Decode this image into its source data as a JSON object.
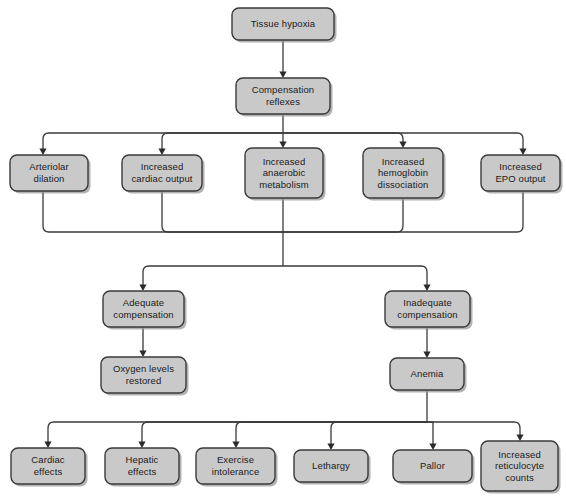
{
  "diagram": {
    "colors": {
      "node_fill": "#c9c9c9",
      "node_border": "#3a3a3a",
      "node_shadow": "#9a9a9a",
      "edge": "#3a3a3a",
      "text": "#1a1a1a",
      "background": "#ffffff"
    },
    "nodes": [
      {
        "id": "tissue-hypoxia",
        "lines": [
          "Tissue hypoxia"
        ],
        "x": 232,
        "y": 8,
        "w": 102,
        "h": 32
      },
      {
        "id": "compensation-reflexes",
        "lines": [
          "Compensation",
          "reflexes"
        ],
        "x": 236,
        "y": 78,
        "w": 94,
        "h": 36
      },
      {
        "id": "arteriolar-dilation",
        "lines": [
          "Arteriolar",
          "dilation"
        ],
        "x": 10,
        "y": 155,
        "w": 78,
        "h": 36
      },
      {
        "id": "increased-cardiac-output",
        "lines": [
          "Increased",
          "cardiac output"
        ],
        "x": 122,
        "y": 155,
        "w": 80,
        "h": 36
      },
      {
        "id": "increased-anaerobic-metabolism",
        "lines": [
          "Increased",
          "anaerobic",
          "metabolism"
        ],
        "x": 245,
        "y": 148,
        "w": 78,
        "h": 50
      },
      {
        "id": "increased-hemoglobin-dissociation",
        "lines": [
          "Increased",
          "hemoglobin",
          "dissociation"
        ],
        "x": 363,
        "y": 148,
        "w": 80,
        "h": 50
      },
      {
        "id": "increased-epo-output",
        "lines": [
          "Increased",
          "EPO output"
        ],
        "x": 481,
        "y": 155,
        "w": 79,
        "h": 36
      },
      {
        "id": "adequate-compensation",
        "lines": [
          "Adequate",
          "compensation"
        ],
        "x": 103,
        "y": 291,
        "w": 81,
        "h": 36
      },
      {
        "id": "inadequate-compensation",
        "lines": [
          "Inadequate",
          "compensation"
        ],
        "x": 385,
        "y": 291,
        "w": 85,
        "h": 36
      },
      {
        "id": "oxygen-levels-restored",
        "lines": [
          "Oxygen levels",
          "restored"
        ],
        "x": 101,
        "y": 357,
        "w": 85,
        "h": 36
      },
      {
        "id": "anemia",
        "lines": [
          "Anemia"
        ],
        "x": 390,
        "y": 358,
        "w": 74,
        "h": 32
      },
      {
        "id": "cardiac-effects",
        "lines": [
          "Cardiac",
          "effects"
        ],
        "x": 11,
        "y": 448,
        "w": 74,
        "h": 36
      },
      {
        "id": "hepatic-effects",
        "lines": [
          "Hepatic",
          "effects"
        ],
        "x": 105,
        "y": 448,
        "w": 74,
        "h": 36
      },
      {
        "id": "exercise-intolerance",
        "lines": [
          "Exercise",
          "intolerance"
        ],
        "x": 196,
        "y": 448,
        "w": 79,
        "h": 36
      },
      {
        "id": "lethargy",
        "lines": [
          "Lethargy"
        ],
        "x": 294,
        "y": 450,
        "w": 74,
        "h": 32
      },
      {
        "id": "pallor",
        "lines": [
          "Pallor"
        ],
        "x": 393,
        "y": 450,
        "w": 79,
        "h": 32
      },
      {
        "id": "increased-reticulocyte-counts",
        "lines": [
          "Increased",
          "reticulocyte",
          "counts"
        ],
        "x": 481,
        "y": 441,
        "w": 77,
        "h": 50
      }
    ],
    "edges": [
      {
        "id": "hypoxia-to-reflexes",
        "path": "M 283 40 L 283 72",
        "arrow": "down",
        "ax": 283,
        "ay": 78
      },
      {
        "id": "reflexes-bus-stem",
        "path": "M 283 114 L 283 133",
        "arrow": "none"
      },
      {
        "id": "reflexes-bus-left",
        "path": "M 283 133 L 49 133 Q 43 133 43 139 L 43 149",
        "arrow": "down",
        "ax": 43,
        "ay": 155
      },
      {
        "id": "reflexes-to-cardiac",
        "path": "M 283 133 L 168 133 Q 162 133 162 139 L 162 149",
        "arrow": "down",
        "ax": 162,
        "ay": 155
      },
      {
        "id": "reflexes-to-anaerobic",
        "path": "M 283 133 L 283 142",
        "arrow": "down",
        "ax": 283,
        "ay": 148
      },
      {
        "id": "reflexes-to-hemoglobin",
        "path": "M 283 133 L 397 133 Q 403 133 403 139 L 403 142",
        "arrow": "down",
        "ax": 403,
        "ay": 148
      },
      {
        "id": "reflexes-bus-right",
        "path": "M 283 133 L 517 133 Q 523 133 523 139 L 523 149",
        "arrow": "down",
        "ax": 523,
        "ay": 155
      },
      {
        "id": "arteriolar-merge",
        "path": "M 43 191 L 43 226 Q 43 232 49 232 L 283 232",
        "arrow": "none"
      },
      {
        "id": "cardiac-merge",
        "path": "M 162 191 L 162 226 Q 162 232 168 232 L 283 232",
        "arrow": "none"
      },
      {
        "id": "anaerobic-merge",
        "path": "M 283 198 L 283 232",
        "arrow": "none"
      },
      {
        "id": "hemoglobin-merge",
        "path": "M 403 198 L 403 226 Q 403 232 397 232 L 283 232",
        "arrow": "none"
      },
      {
        "id": "epo-merge",
        "path": "M 523 191 L 523 226 Q 523 232 517 232 L 283 232",
        "arrow": "none"
      },
      {
        "id": "merge-stem",
        "path": "M 283 232 L 283 266",
        "arrow": "none"
      },
      {
        "id": "split-to-adequate",
        "path": "M 283 266 L 149 266 Q 143 266 143 272 L 143 285",
        "arrow": "down",
        "ax": 143,
        "ay": 291
      },
      {
        "id": "split-to-inadequate",
        "path": "M 283 266 L 421 266 Q 427 266 427 272 L 427 285",
        "arrow": "down",
        "ax": 427,
        "ay": 291
      },
      {
        "id": "adequate-to-oxygen",
        "path": "M 143 327 L 143 351",
        "arrow": "down",
        "ax": 143,
        "ay": 357
      },
      {
        "id": "inadequate-to-anemia",
        "path": "M 427 327 L 427 352",
        "arrow": "down",
        "ax": 427,
        "ay": 358
      },
      {
        "id": "anemia-bus-stem",
        "path": "M 427 390 L 427 422",
        "arrow": "none"
      },
      {
        "id": "anemia-to-cardiac-effects",
        "path": "M 427 422 L 54 422 Q 48 422 48 428 L 48 442",
        "arrow": "down",
        "ax": 48,
        "ay": 448
      },
      {
        "id": "anemia-to-hepatic-effects",
        "path": "M 427 422 L 148 422 Q 142 422 142 428 L 142 442",
        "arrow": "down",
        "ax": 142,
        "ay": 448
      },
      {
        "id": "anemia-to-exercise-intolerance",
        "path": "M 427 422 L 242 422 Q 236 422 236 428 L 236 442",
        "arrow": "down",
        "ax": 236,
        "ay": 448
      },
      {
        "id": "anemia-to-lethargy",
        "path": "M 427 422 L 337 422 Q 331 422 331 428 L 331 444",
        "arrow": "down",
        "ax": 331,
        "ay": 450
      },
      {
        "id": "anemia-to-pallor",
        "path": "M 427 422 L 433 422 L 433 444",
        "arrow": "down",
        "ax": 433,
        "ay": 450
      },
      {
        "id": "anemia-to-reticulocyte",
        "path": "M 427 422 L 514 422 Q 520 422 520 428 L 520 435",
        "arrow": "down",
        "ax": 520,
        "ay": 441
      }
    ]
  }
}
